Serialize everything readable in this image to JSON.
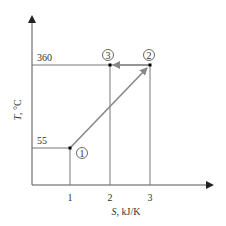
{
  "diagram": {
    "type": "T-S process diagram",
    "y_axis": {
      "label_var": "T",
      "label_unit": ", °C",
      "ticks": [
        "360",
        "55"
      ]
    },
    "x_axis": {
      "label_var": "S",
      "label_unit": ", kJ/K",
      "ticks": [
        "1",
        "2",
        "3"
      ]
    },
    "states": [
      {
        "id": "1",
        "label": "1",
        "S": 1,
        "T": 55
      },
      {
        "id": "2",
        "label": "2",
        "S": 3,
        "T": 360
      },
      {
        "id": "3",
        "label": "3",
        "S": 2,
        "T": 360
      }
    ],
    "processes": [
      {
        "from": "1",
        "to": "2",
        "kind": "arrow"
      },
      {
        "from": "2",
        "to": "3",
        "kind": "arrow"
      }
    ],
    "colors": {
      "axis": "#555555",
      "process": "#888888",
      "point": "#000000",
      "text": "#333333"
    }
  }
}
